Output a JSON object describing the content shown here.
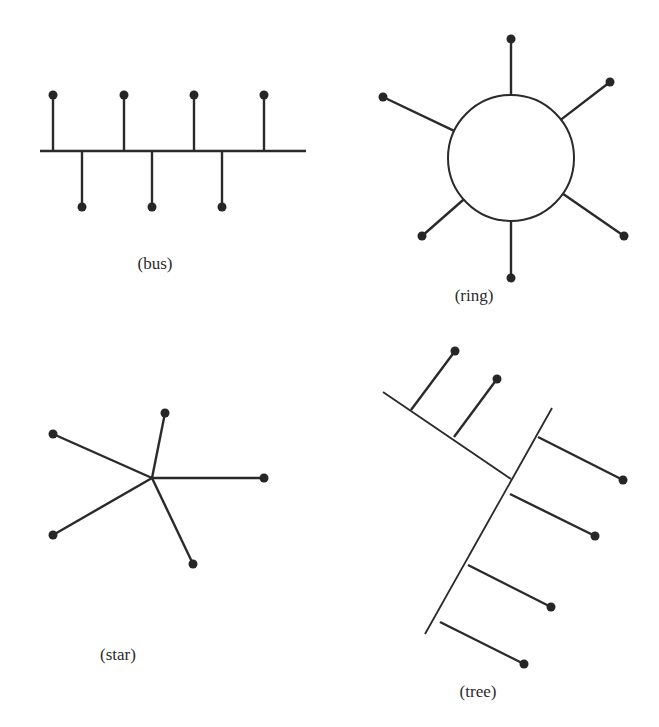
{
  "figure": {
    "colors": {
      "ink": "#2a2a2a",
      "background": "#ffffff"
    },
    "panels": [
      {
        "id": "bus",
        "label": "(bus)",
        "label_pos": [
          155,
          254
        ]
      },
      {
        "id": "ring",
        "label": "(ring)",
        "label_pos": [
          474,
          286
        ]
      },
      {
        "id": "star",
        "label": "(star)",
        "label_pos": [
          118,
          645
        ]
      },
      {
        "id": "tree",
        "label": "(tree)",
        "label_pos": [
          478,
          682
        ]
      }
    ],
    "bus": {
      "backbone": [
        40,
        151,
        306,
        151
      ],
      "up_nodes_x": [
        53,
        124,
        194,
        264
      ],
      "up_node_y": 95,
      "down_nodes_x": [
        82,
        152,
        222
      ],
      "down_node_y": 207
    },
    "ring": {
      "center": [
        511,
        158
      ],
      "radius": 63,
      "nodes": [
        [
          511,
          39
        ],
        [
          610,
          82
        ],
        [
          624,
          236
        ],
        [
          511,
          278
        ],
        [
          422,
          236
        ],
        [
          383,
          97
        ]
      ]
    },
    "star": {
      "hub": [
        152,
        478
      ],
      "nodes": [
        [
          165,
          413
        ],
        [
          53,
          434
        ],
        [
          264,
          478
        ],
        [
          53,
          535
        ],
        [
          193,
          564
        ]
      ]
    },
    "tree": {
      "trunks": [
        [
          383,
          392,
          511,
          479
        ],
        [
          552,
          408,
          425,
          634
        ]
      ],
      "branches": [
        [
          411,
          410,
          455,
          351
        ],
        [
          454,
          437,
          497,
          379
        ],
        [
          538,
          437,
          623,
          480
        ],
        [
          510,
          494,
          595,
          536
        ],
        [
          468,
          565,
          551,
          607
        ],
        [
          440,
          622,
          524,
          664
        ]
      ]
    }
  }
}
